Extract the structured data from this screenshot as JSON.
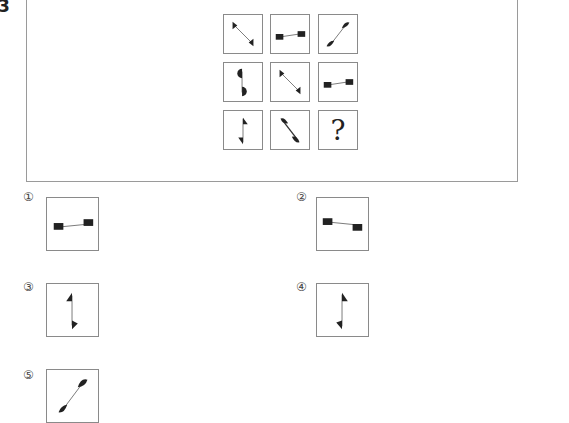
{
  "question": {
    "number": "3"
  },
  "grid": {
    "cells": [
      {
        "row": 1,
        "col": 1,
        "figure": "diagonal-line-down-right-triangle-ends"
      },
      {
        "row": 1,
        "col": 2,
        "figure": "horizontal-line-square-ends-right-higher"
      },
      {
        "row": 1,
        "col": 3,
        "figure": "diagonal-line-up-right-semicircle-ends"
      },
      {
        "row": 2,
        "col": 1,
        "figure": "vertical-line-semicircle-ends"
      },
      {
        "row": 2,
        "col": 2,
        "figure": "diagonal-line-down-right-triangle-ends"
      },
      {
        "row": 2,
        "col": 3,
        "figure": "horizontal-line-square-ends-right-higher"
      },
      {
        "row": 3,
        "col": 1,
        "figure": "vertical-line-flag-triangle-ends"
      },
      {
        "row": 3,
        "col": 2,
        "figure": "diagonal-line-down-right-semicircle-ends"
      },
      {
        "row": 3,
        "col": 3,
        "figure": "question-mark",
        "text": "?"
      }
    ]
  },
  "options": [
    {
      "label": "①",
      "figure": "horizontal-line-square-ends-right-higher"
    },
    {
      "label": "②",
      "figure": "horizontal-line-square-ends-left-higher"
    },
    {
      "label": "③",
      "figure": "vertical-line-triangle-ends-left-up"
    },
    {
      "label": "④",
      "figure": "vertical-line-triangle-ends-right-top"
    },
    {
      "label": "⑤",
      "figure": "diagonal-line-up-right-semicircle-ends"
    }
  ]
}
